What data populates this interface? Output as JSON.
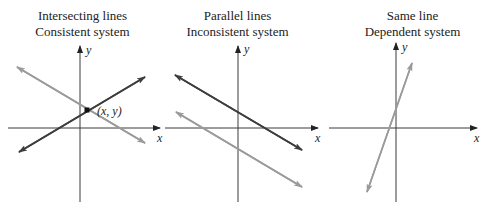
{
  "colors": {
    "axis": "#3a3a3a",
    "dark_line": "#3d3d3d",
    "light_line": "#9a9a9a",
    "text": "#222222"
  },
  "panels": [
    {
      "title_line1": "Intersecting lines",
      "title_line2": "Consistent system",
      "x_label": "x",
      "y_label": "y",
      "point_label": "(x, y)",
      "lines": [
        "dark line rising left-to-right",
        "light line falling left-to-right"
      ],
      "note": "Lines cross at a single point (x, y)"
    },
    {
      "title_line1": "Parallel lines",
      "title_line2": "Inconsistent system",
      "x_label": "x",
      "y_label": "y",
      "lines": [
        "dark line falling",
        "light line falling (parallel, lower)"
      ],
      "note": "Lines never intersect"
    },
    {
      "title_line1": "Same line",
      "title_line2": "Dependent system",
      "x_label": "x",
      "y_label": "y",
      "lines": [
        "single steep rising line (both equations coincide)"
      ],
      "note": "Lines coincide"
    }
  ]
}
